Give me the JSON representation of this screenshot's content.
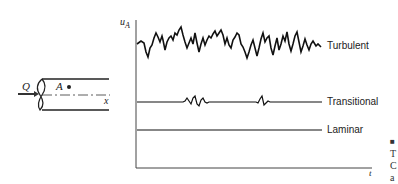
{
  "pipe": {
    "flow_label": "Q",
    "point_label": "A",
    "axis_label": "x"
  },
  "plot": {
    "y_axis_label": "u",
    "y_axis_subscript": "A",
    "x_axis_label": "t",
    "traces": [
      {
        "name": "turbulent",
        "label": "Turbulent"
      },
      {
        "name": "transitional",
        "label": "Transitional"
      },
      {
        "name": "laminar",
        "label": "Laminar"
      }
    ]
  },
  "caption_fragment": {
    "lines": [
      "■",
      "T",
      "C",
      "a"
    ]
  }
}
